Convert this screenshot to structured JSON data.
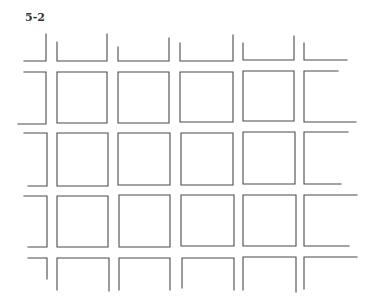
{
  "figure": {
    "label": "5-2",
    "stroke_color": "#4a4a4a",
    "background": "#ffffff"
  },
  "grid": {
    "shapes": [
      {
        "name": "top-row-partial-1",
        "d": "M46 34 L46 61 L24 61"
      },
      {
        "name": "top-row-partial-2",
        "d": "M57 42 L57 61 L107 61 L107 34"
      },
      {
        "name": "top-row-partial-3",
        "d": "M118 47 L118 61 L169 61 L169 38"
      },
      {
        "name": "top-row-partial-4",
        "d": "M180 43 L180 61 L233 61 L233 35"
      },
      {
        "name": "top-row-partial-5",
        "d": "M243 43 L243 60 L294 60 L294 36"
      },
      {
        "name": "top-row-partial-6",
        "d": "M304 43 L304 60 L347 60"
      },
      {
        "name": "row1-left-partial",
        "d": "M24 72 L46 72 L46 124 L18 124"
      },
      {
        "name": "row1-cell-1",
        "d": "M57 72 L107 72 L107 123 L57 123 Z"
      },
      {
        "name": "row1-cell-2",
        "d": "M118 72 L169 72 L169 123 L118 123 Z"
      },
      {
        "name": "row1-cell-3",
        "d": "M180 72 L233 72 L233 122 L180 122 Z"
      },
      {
        "name": "row1-cell-4",
        "d": "M243 71 L294 71 L294 121 L243 121 Z"
      },
      {
        "name": "row1-right-partial",
        "d": "M338 71 L304 71 L304 122 L356 122"
      },
      {
        "name": "row2-left-partial",
        "d": "M24 133 L47 133 L47 186 L28 186"
      },
      {
        "name": "row2-cell-1",
        "d": "M57 133 L108 133 L108 186 L57 186 Z"
      },
      {
        "name": "row2-cell-2",
        "d": "M118 133 L170 133 L170 185 L118 185 Z"
      },
      {
        "name": "row2-cell-3",
        "d": "M181 133 L233 133 L233 185 L181 185 Z"
      },
      {
        "name": "row2-cell-4",
        "d": "M243 132 L295 132 L295 184 L243 184 Z"
      },
      {
        "name": "row2-right-partial",
        "d": "M348 132 L304 132 L304 184 L341 184"
      },
      {
        "name": "row3-left-partial",
        "d": "M24 196 L47 196 L47 247 L28 247"
      },
      {
        "name": "row3-cell-1",
        "d": "M57 196 L108 196 L108 247 L57 247 Z"
      },
      {
        "name": "row3-cell-2",
        "d": "M119 195 L170 195 L170 247 L119 247 Z"
      },
      {
        "name": "row3-cell-3",
        "d": "M181 195 L234 195 L234 246 L181 246 Z"
      },
      {
        "name": "row3-cell-4",
        "d": "M243 195 L296 195 L296 246 L243 246 Z"
      },
      {
        "name": "row3-right-partial",
        "d": "M357 195 L304 195 L304 246 L349 246"
      },
      {
        "name": "bottom-row-partial-1",
        "d": "M28 258 L47 258 L47 279"
      },
      {
        "name": "bottom-row-partial-2",
        "d": "M57 290 L57 258 L109 258 L109 291"
      },
      {
        "name": "bottom-row-partial-3",
        "d": "M119 290 L119 258 L170 258 L170 290"
      },
      {
        "name": "bottom-row-partial-4",
        "d": "M182 288 L182 258 L234 258 L234 290"
      },
      {
        "name": "bottom-row-partial-5",
        "d": "M243 290 L243 257 L296 257 L296 292"
      },
      {
        "name": "bottom-row-partial-6",
        "d": "M304 289 L304 257 L357 257"
      }
    ]
  }
}
